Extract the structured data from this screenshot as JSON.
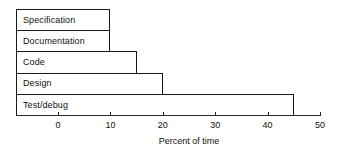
{
  "chart_data": {
    "type": "bar",
    "orientation": "horizontal",
    "title": "",
    "xlabel": "Percent of time",
    "ylabel": "",
    "categories": [
      "Specification",
      "Documentation",
      "Code",
      "Design",
      "Test/debug"
    ],
    "values": [
      10,
      10,
      15,
      20,
      45
    ],
    "xlim": [
      0,
      50
    ],
    "xticks": [
      0,
      10,
      20,
      30,
      40,
      50
    ],
    "xtick_labels": [
      "0",
      "10",
      "20",
      "30",
      "40",
      "50"
    ],
    "grid": false,
    "legend": null,
    "colors": {
      "bar_fill": "#ffffff",
      "bar_stroke": "#1a1a1a",
      "axis": "#2b2b2b",
      "text": "#111111",
      "background": "#ffffff"
    }
  }
}
